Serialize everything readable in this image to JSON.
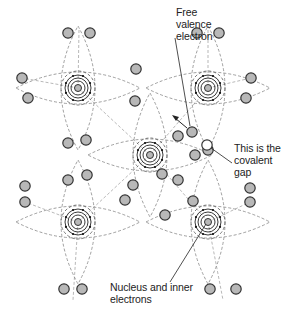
{
  "diagram": {
    "colors": {
      "background": "#ffffff",
      "electron_fill": "#b8b8b8",
      "electron_stroke": "#333333",
      "dashed_bond": "#888888",
      "orbit": "#222222",
      "label_text": "#222222"
    },
    "labels": {
      "free_electron": [
        "Free",
        "valence",
        "electron"
      ],
      "covalent_gap": [
        "This is the",
        "covalent",
        "gap"
      ],
      "nucleus": [
        "Nucleus and inner",
        "electrons"
      ]
    },
    "atoms": [
      {
        "id": "top-left",
        "cx": 78,
        "cy": 88
      },
      {
        "id": "top-right",
        "cx": 208,
        "cy": 88
      },
      {
        "id": "center",
        "cx": 150,
        "cy": 155
      },
      {
        "id": "bottom-left",
        "cx": 78,
        "cy": 222
      },
      {
        "id": "bottom-right",
        "cx": 208,
        "cy": 222
      }
    ],
    "valence_electrons": [
      [
        68,
        33
      ],
      [
        90,
        33
      ],
      [
        197,
        33
      ],
      [
        219,
        33
      ],
      [
        22,
        78
      ],
      [
        28,
        98
      ],
      [
        136,
        69
      ],
      [
        135,
        101
      ],
      [
        251,
        78
      ],
      [
        246,
        98
      ],
      [
        68,
        143
      ],
      [
        86,
        140
      ],
      [
        87,
        175
      ],
      [
        68,
        180
      ],
      [
        178,
        136
      ],
      [
        195,
        155
      ],
      [
        208,
        150
      ],
      [
        25,
        186
      ],
      [
        25,
        202
      ],
      [
        133,
        185
      ],
      [
        125,
        200
      ],
      [
        162,
        174
      ],
      [
        178,
        180
      ],
      [
        250,
        188
      ],
      [
        250,
        202
      ],
      [
        193,
        201
      ],
      [
        165,
        215
      ],
      [
        64,
        289
      ],
      [
        82,
        289
      ],
      [
        210,
        289
      ],
      [
        236,
        289
      ]
    ],
    "free_electron": {
      "cx": 192,
      "cy": 132
    },
    "hole": {
      "cx": 207,
      "cy": 145
    }
  }
}
